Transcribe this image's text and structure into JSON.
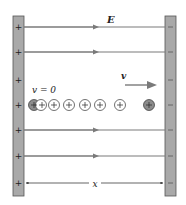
{
  "diagram": {
    "labels": {
      "field": "E",
      "initial_velocity": "v = 0",
      "velocity": "v",
      "distance": "x"
    },
    "left_plate": {
      "charge_sign": "+",
      "sign_count": 7,
      "color": "#a9a9a9"
    },
    "right_plate": {
      "charge_sign": "−",
      "sign_count": 7,
      "color": "#a9a9a9"
    },
    "field_lines": {
      "count": 4,
      "direction": "right",
      "color": "#7a7a7a"
    },
    "particles": {
      "symbol": "+",
      "trail_count": 7,
      "start_fill": "#8c8c8c",
      "end_fill": "#8c8c8c"
    },
    "colors": {
      "line": "#7a7a7a",
      "plate": "#a9a9a9",
      "plate_border": "#555555",
      "text": "#222222"
    }
  }
}
